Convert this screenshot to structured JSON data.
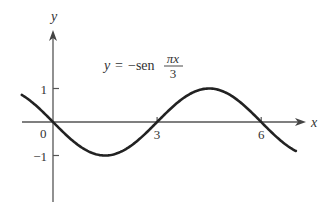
{
  "chart_data": {
    "type": "line",
    "title": "",
    "equation": {
      "lhs": "y",
      "eq": "=",
      "func": "−sen",
      "numerator": "πx",
      "denominator": "3"
    },
    "xlabel": "x",
    "ylabel": "y",
    "x_ticks": [
      {
        "value": 3,
        "label": "3"
      },
      {
        "value": 6,
        "label": "6"
      }
    ],
    "y_ticks": [
      {
        "value": 1,
        "label": "1"
      },
      {
        "value": -1,
        "label": "−1"
      }
    ],
    "origin_label": "0",
    "xlim": [
      -0.9,
      7.0
    ],
    "ylim": [
      -2.4,
      2.8
    ],
    "grid": false,
    "legend": "none",
    "series": [
      {
        "name": "y = -sen(πx/3)",
        "x": [
          -0.9,
          -0.5,
          0,
          0.75,
          1.5,
          2.25,
          3,
          3.75,
          4.5,
          5.25,
          6,
          6.5,
          7.0
        ],
        "values": [
          0.81,
          0.5,
          0,
          -0.71,
          -1,
          -0.71,
          0,
          0.71,
          1,
          0.71,
          0,
          -0.5,
          -0.87
        ]
      }
    ],
    "colors": {
      "curve": "#222222",
      "axes": "#555555",
      "text": "#333333"
    }
  }
}
